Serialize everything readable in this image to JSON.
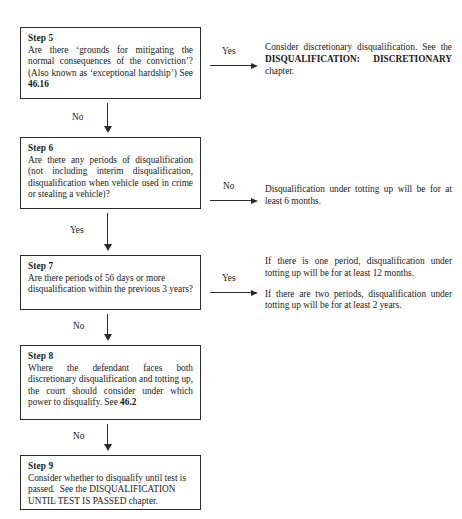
{
  "document": {
    "type": "flowchart",
    "subject": "Disqualification decision flowchart (Steps 5-9)"
  },
  "steps": [
    {
      "id": "step5",
      "title": "Step 5",
      "body_html": "Are there &lsquo;grounds for mitigating the normal consequences of the conviction&rsquo;? (Also known as &lsquo;exceptional hardship&rsquo;) See <b class=\"ref\">46.16</b>",
      "body_text": "Are there 'grounds for mitigating the normal consequences of the conviction'? (Also known as 'exceptional hardship') See 46.16",
      "reference": "46.16"
    },
    {
      "id": "step6",
      "title": "Step 6",
      "body_html": "Are there any periods of disqualification (not including interim disqualification, disqualification when vehicle used in crime or stealing a vehicle)?",
      "body_text": "Are there any periods of disqualification (not including interim disqualification, disqualification when vehicle used in crime or stealing a vehicle)?",
      "reference": ""
    },
    {
      "id": "step7",
      "title": "Step 7",
      "body_html": "Are there periods of 56 days or more disqualification within the previous 3 years?",
      "body_text": "Are there periods of 56 days or more disqualification within the previous 3 years?",
      "reference": ""
    },
    {
      "id": "step8",
      "title": "Step 8",
      "body_html": "Where the defendant faces both discretionary disqualification and totting up, the court should consider under which power to disqualify. See <b class=\"ref\">46.2</b>",
      "body_text": "Where the defendant faces both discretionary disqualification and totting up, the court should consider under which power to disqualify. See 46.2",
      "reference": "46.2"
    },
    {
      "id": "step9",
      "title": "Step 9",
      "body_html": "Consider whether to disqualify until test is passed.&nbsp; See the <span class=\"caps\">DISQUALIFICATION UNTIL TEST IS PASSED</span> chapter.",
      "body_text": "Consider whether to disqualify until test is passed. See the DISQUALIFICATION UNTIL TEST IS PASSED chapter.",
      "reference": "DISQUALIFICATION UNTIL TEST IS PASSED"
    }
  ],
  "outcomes": [
    {
      "id": "outcome5",
      "from_step": "Step 5",
      "branch": "Yes",
      "paragraphs_html": [
        "Consider discretionary disqualification. See the <span class=\"caps\">DISQUALIFICATION: DISCRETIONARY</span> chapter."
      ],
      "paragraphs_text": [
        "Consider discretionary disqualification. See the DISQUALIFICATION: DISCRETIONARY chapter."
      ]
    },
    {
      "id": "outcome6",
      "from_step": "Step 6",
      "branch": "No",
      "paragraphs_html": [
        "Disqualification under totting up will be for at least 6 months."
      ],
      "paragraphs_text": [
        "Disqualification under totting up will be for at least 6 months."
      ]
    },
    {
      "id": "outcome7",
      "from_step": "Step 7",
      "branch": "Yes",
      "paragraphs_html": [
        "If there is one period, disqualification under totting up will be for at least 12 months.",
        "If there are two periods, disqualification under totting up will be for at least 2 years."
      ],
      "paragraphs_text": [
        "If there is one period, disqualification under totting up will be for at least 12 months.",
        "If there are two periods, disqualification under totting up will be for at least 2 years."
      ]
    }
  ],
  "arrow_labels": {
    "step5_yes": "Yes",
    "step5_no": "No",
    "step6_no": "No",
    "step6_yes": "Yes",
    "step7_yes": "Yes",
    "step7_no": "No",
    "step8_no": "No"
  },
  "colors": {
    "border": "#2b2b2b",
    "text": "#1a1a1a",
    "background": "#ffffff"
  },
  "footer_fragment": ""
}
